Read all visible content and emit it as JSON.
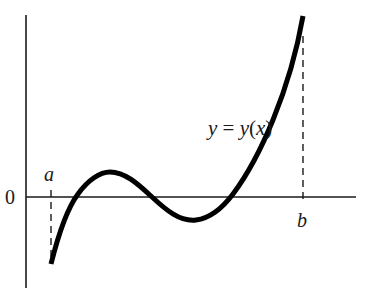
{
  "diagram": {
    "title": "",
    "curve_label": "y = y(x)",
    "curve_label_parts": [
      "y",
      " = ",
      "y",
      "(",
      "x",
      ")"
    ],
    "origin_label": "0",
    "left_endpoint_label": "a",
    "right_endpoint_label": "b",
    "colors": {
      "curve": "#000000",
      "axis": "#1a1a1a",
      "dashed": "#1a1a1a",
      "background": "#ffffff"
    }
  }
}
